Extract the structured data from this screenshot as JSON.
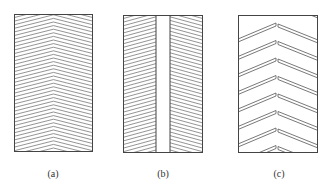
{
  "figure": {
    "panels": [
      {
        "id": "a",
        "caption": "(a)",
        "pattern": "continuous-chevron-hatching"
      },
      {
        "id": "b",
        "caption": "(b)",
        "pattern": "split-chevron-hatching-with-center-strip"
      },
      {
        "id": "c",
        "caption": "(c)",
        "pattern": "staggered-chevron-grooves"
      }
    ]
  },
  "style": {
    "line_color": "#555555",
    "border_color": "#444444",
    "background": "#ffffff"
  }
}
